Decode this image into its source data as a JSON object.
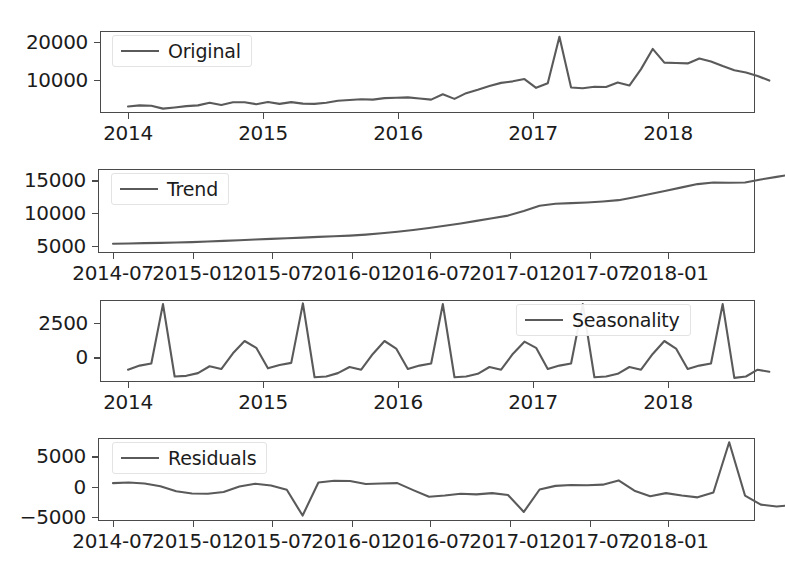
{
  "figure": {
    "background_color": "#ffffff",
    "line_color": "#5a5a5a",
    "axis_color": "#4a4a4a",
    "text_color": "#1c1c1c"
  },
  "chart_data": [
    {
      "type": "line",
      "name": "original",
      "title": "",
      "xlabel": "",
      "ylabel": "",
      "legend": "Original",
      "legend_position": "upper left",
      "grid": false,
      "ylim": [
        3000,
        24500
      ],
      "yticks": [
        10000,
        20000
      ],
      "ytick_labels": [
        "10000",
        "20000"
      ],
      "xlim": [
        "2013-12-01",
        "2018-10-15"
      ],
      "xticks": [
        "2014",
        "2015",
        "2016",
        "2017",
        "2018"
      ],
      "xtick_labels": [
        "2014",
        "2015",
        "2016",
        "2017",
        "2018"
      ],
      "x": [
        "2014-01",
        "2014-02",
        "2014-03",
        "2014-04",
        "2014-05",
        "2014-06",
        "2014-07",
        "2014-08",
        "2014-09",
        "2014-10",
        "2014-11",
        "2014-12",
        "2015-01",
        "2015-02",
        "2015-03",
        "2015-04",
        "2015-05",
        "2015-06",
        "2015-07",
        "2015-08",
        "2015-09",
        "2015-10",
        "2015-11",
        "2015-12",
        "2016-01",
        "2016-02",
        "2016-03",
        "2016-04",
        "2016-05",
        "2016-06",
        "2016-07",
        "2016-08",
        "2016-09",
        "2016-10",
        "2016-11",
        "2016-12",
        "2017-01",
        "2017-02",
        "2017-03",
        "2017-04",
        "2017-05",
        "2017-06",
        "2017-07",
        "2017-08",
        "2017-09",
        "2017-10",
        "2017-11",
        "2017-12",
        "2018-01",
        "2018-02",
        "2018-03",
        "2018-04",
        "2018-05",
        "2018-06",
        "2018-07",
        "2018-08"
      ],
      "values": [
        4700,
        5000,
        4900,
        4150,
        4450,
        4800,
        5000,
        5700,
        5100,
        5800,
        5800,
        5300,
        5900,
        5400,
        5850,
        5450,
        5400,
        5700,
        6200,
        6400,
        6600,
        6500,
        6900,
        7000,
        7100,
        6800,
        6500,
        7900,
        6700,
        8200,
        9100,
        10100,
        10900,
        11300,
        11900,
        9600,
        10800,
        23000,
        9700,
        9500,
        9900,
        9800,
        11000,
        10200,
        14500,
        19800,
        16200,
        16100,
        16000,
        17300,
        16500,
        15300,
        14200,
        13600,
        12700,
        11500
      ]
    },
    {
      "type": "line",
      "name": "trend",
      "title": "",
      "xlabel": "",
      "ylabel": "",
      "legend": "Trend",
      "legend_position": "upper left",
      "grid": false,
      "ylim": [
        3900,
        16700
      ],
      "yticks": [
        5000,
        10000,
        15000
      ],
      "ytick_labels": [
        "5000",
        "10000",
        "15000"
      ],
      "xlim": [
        "2014-04-01",
        "2018-05-15"
      ],
      "xticks": [
        "2014-07",
        "2015-01",
        "2015-07",
        "2016-01",
        "2016-07",
        "2017-01",
        "2017-07",
        "2018-01"
      ],
      "xtick_labels": [
        "2014-07",
        "2015-01",
        "2015-07",
        "2016-01",
        "2016-07",
        "2017-01",
        "2017-07",
        "2018-01"
      ],
      "x": [
        "2014-07",
        "2014-08",
        "2014-09",
        "2014-10",
        "2014-11",
        "2014-12",
        "2015-01",
        "2015-02",
        "2015-03",
        "2015-04",
        "2015-05",
        "2015-06",
        "2015-07",
        "2015-08",
        "2015-09",
        "2015-10",
        "2015-11",
        "2015-12",
        "2016-01",
        "2016-02",
        "2016-03",
        "2016-04",
        "2016-05",
        "2016-06",
        "2016-07",
        "2016-08",
        "2016-09",
        "2016-10",
        "2016-11",
        "2016-12",
        "2017-01",
        "2017-02",
        "2017-03",
        "2017-04",
        "2017-05",
        "2017-06",
        "2017-07",
        "2017-08",
        "2017-09",
        "2017-10",
        "2017-11",
        "2017-12",
        "2018-01",
        "2018-02"
      ],
      "values": [
        5300,
        5350,
        5400,
        5450,
        5500,
        5550,
        5650,
        5750,
        5850,
        5950,
        6050,
        6150,
        6250,
        6350,
        6450,
        6550,
        6700,
        6900,
        7150,
        7400,
        7700,
        8050,
        8400,
        8800,
        9200,
        9600,
        10300,
        11100,
        11400,
        11500,
        11600,
        11750,
        11950,
        12400,
        12900,
        13400,
        13900,
        14400,
        14650,
        14600,
        14650,
        15100,
        15500,
        15900
      ]
    },
    {
      "type": "line",
      "name": "seasonality",
      "title": "",
      "xlabel": "",
      "ylabel": "",
      "legend": "Seasonality",
      "legend_position": "upper right",
      "grid": false,
      "ylim": [
        -1600,
        4400
      ],
      "yticks": [
        0,
        2500
      ],
      "ytick_labels": [
        "0",
        "2500"
      ],
      "xlim": [
        "2013-12-01",
        "2018-10-15"
      ],
      "xticks": [
        "2014",
        "2015",
        "2016",
        "2017",
        "2018"
      ],
      "xtick_labels": [
        "2014",
        "2015",
        "2016",
        "2017",
        "2018"
      ],
      "x": [
        "2014-01",
        "2014-02",
        "2014-03",
        "2014-04",
        "2014-05",
        "2014-06",
        "2014-07",
        "2014-08",
        "2014-09",
        "2014-10",
        "2014-11",
        "2014-12",
        "2015-01",
        "2015-02",
        "2015-03",
        "2015-04",
        "2015-05",
        "2015-06",
        "2015-07",
        "2015-08",
        "2015-09",
        "2015-10",
        "2015-11",
        "2015-12",
        "2016-01",
        "2016-02",
        "2016-03",
        "2016-04",
        "2016-05",
        "2016-06",
        "2016-07",
        "2016-08",
        "2016-09",
        "2016-10",
        "2016-11",
        "2016-12",
        "2017-01",
        "2017-02",
        "2017-03",
        "2017-04",
        "2017-05",
        "2017-06",
        "2017-07",
        "2017-08",
        "2017-09",
        "2017-10",
        "2017-11",
        "2017-12",
        "2018-01",
        "2018-02",
        "2018-03",
        "2018-04",
        "2018-05",
        "2018-06",
        "2018-07",
        "2018-08"
      ],
      "values": [
        -700,
        -400,
        -250,
        4100,
        -1200,
        -1150,
        -950,
        -450,
        -650,
        500,
        1400,
        900,
        -600,
        -350,
        -200,
        4150,
        -1250,
        -1200,
        -950,
        -500,
        -700,
        450,
        1400,
        850,
        -650,
        -400,
        -250,
        4100,
        -1250,
        -1200,
        -1000,
        -500,
        -700,
        450,
        1350,
        900,
        -650,
        -400,
        -250,
        4100,
        -1250,
        -1200,
        -1000,
        -500,
        -700,
        450,
        1400,
        850,
        -650,
        -400,
        -250,
        4100,
        -1300,
        -1200,
        -700,
        -850
      ]
    },
    {
      "type": "line",
      "name": "residuals",
      "title": "",
      "xlabel": "",
      "ylabel": "",
      "legend": "Residuals",
      "legend_position": "upper left",
      "grid": false,
      "ylim": [
        -5400,
        8300
      ],
      "yticks": [
        -5000,
        0,
        5000
      ],
      "ytick_labels": [
        "−5000",
        "0",
        "5000"
      ],
      "xlim": [
        "2014-04-01",
        "2018-05-15"
      ],
      "xticks": [
        "2014-07",
        "2015-01",
        "2015-07",
        "2016-01",
        "2016-07",
        "2017-01",
        "2017-07",
        "2018-01"
      ],
      "xtick_labels": [
        "2014-07",
        "2015-01",
        "2015-07",
        "2016-01",
        "2016-07",
        "2017-01",
        "2017-07",
        "2018-01"
      ],
      "x": [
        "2014-07",
        "2014-08",
        "2014-09",
        "2014-10",
        "2014-11",
        "2014-12",
        "2015-01",
        "2015-02",
        "2015-03",
        "2015-04",
        "2015-05",
        "2015-06",
        "2015-07",
        "2015-08",
        "2015-09",
        "2015-10",
        "2015-11",
        "2015-12",
        "2016-01",
        "2016-02",
        "2016-03",
        "2016-04",
        "2016-05",
        "2016-06",
        "2016-07",
        "2016-08",
        "2016-09",
        "2016-10",
        "2016-11",
        "2016-12",
        "2017-01",
        "2017-02",
        "2017-03",
        "2017-04",
        "2017-05",
        "2017-06",
        "2017-07",
        "2017-08",
        "2017-09",
        "2017-10",
        "2017-11",
        "2017-12",
        "2018-01",
        "2018-02"
      ],
      "values": [
        850,
        950,
        800,
        350,
        -500,
        -850,
        -900,
        -600,
        300,
        750,
        450,
        -250,
        -4500,
        950,
        1250,
        1200,
        700,
        800,
        850,
        -300,
        -1400,
        -1200,
        -900,
        -1000,
        -800,
        -1100,
        -3900,
        -200,
        400,
        550,
        500,
        600,
        1300,
        -400,
        -1300,
        -800,
        -1200,
        -1500,
        -700,
        7600,
        -1200,
        -2700,
        -3000,
        -2800,
        -3400,
        2000,
        3600,
        2500,
        1500,
        900,
        500,
        250
      ]
    }
  ]
}
